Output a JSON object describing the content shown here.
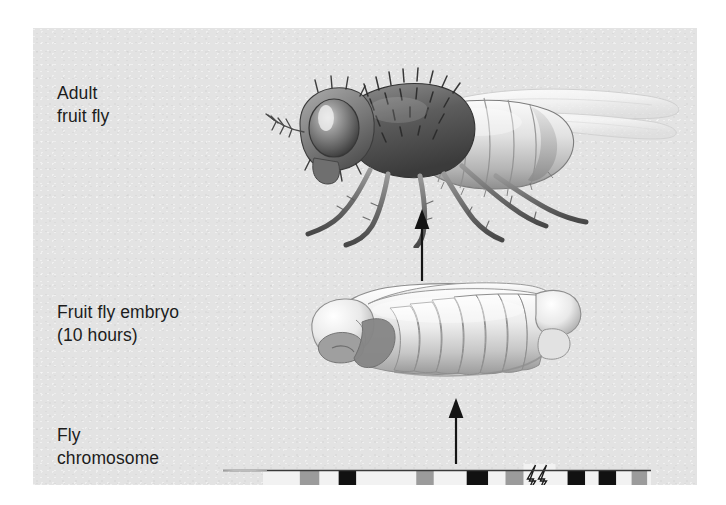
{
  "figure": {
    "background_color": "#e3e3e3",
    "page_background_color": "#ffffff"
  },
  "labels": {
    "adult": "Adult\nfruit fly",
    "embryo": "Fruit fly embryo\n(10 hours)",
    "chromosome": "Fly\nchromosome"
  },
  "illustrations": {
    "adult_fly": {
      "name": "adult-fruit-fly-illustration",
      "description": "Side view of an adult Drosophila with bristled thorax, large compound eye, translucent wings and six legs",
      "style": "grayscale airbrush drawing"
    },
    "embryo": {
      "name": "fruit-fly-embryo-illustration",
      "description": "Segmented fruit fly embryo at 10 hours, oriented head-left, showing repeating body segments",
      "style": "grayscale airbrush drawing",
      "segment_count": 14
    }
  },
  "arrows": [
    {
      "name": "arrow-embryo-to-adult",
      "direction": "up",
      "from": "Fruit fly embryo",
      "to": "Adult fruit fly"
    },
    {
      "name": "arrow-chromosome-to-embryo",
      "direction": "up",
      "from": "Fly chromosome",
      "to": "Fruit fly embryo"
    }
  ],
  "chromosome": {
    "name": "fly-chromosome-diagram",
    "break_symbol": "zigzag",
    "line_color": "#3a3a3a",
    "band_colors": {
      "dark": "#111111",
      "light": "#9b9b9b",
      "background": "#f2f2f2"
    },
    "bands": [
      {
        "start_pct": 9.5,
        "width_pct": 5.0,
        "shade": "light"
      },
      {
        "start_pct": 19.5,
        "width_pct": 4.5,
        "shade": "dark"
      },
      {
        "start_pct": 39.5,
        "width_pct": 4.5,
        "shade": "light"
      },
      {
        "start_pct": 52.5,
        "width_pct": 5.5,
        "shade": "dark"
      },
      {
        "start_pct": 62.5,
        "width_pct": 5.0,
        "shade": "light"
      },
      {
        "start_pct": 78.5,
        "width_pct": 4.5,
        "shade": "dark"
      },
      {
        "start_pct": 86.5,
        "width_pct": 4.5,
        "shade": "dark"
      },
      {
        "start_pct": 95.0,
        "width_pct": 4.0,
        "shade": "light"
      }
    ],
    "break_position_pct": 71.0
  },
  "chart_data": {
    "type": "diagram",
    "stages": [
      {
        "order": 1,
        "label": "Fly chromosome"
      },
      {
        "order": 2,
        "label": "Fruit fly embryo (10 hours)"
      },
      {
        "order": 3,
        "label": "Adult fruit fly"
      }
    ]
  }
}
